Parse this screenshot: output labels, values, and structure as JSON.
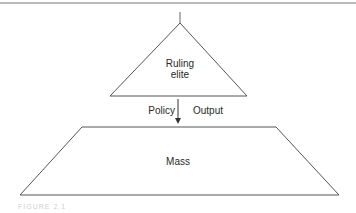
{
  "diagram": {
    "type": "hierarchy",
    "nodes": [
      {
        "id": "ruling-elite",
        "shape": "triangle",
        "label_line1": "Ruling",
        "label_line2": "elite"
      },
      {
        "id": "mass",
        "shape": "trapezoid",
        "label": "Mass"
      }
    ],
    "edges": [
      {
        "from": "ruling-elite",
        "to": "mass",
        "direction": "down",
        "left_label": "Policy",
        "right_label": "Output"
      }
    ],
    "caption": "FIGURE 2.1"
  },
  "colors": {
    "stroke": "#555555",
    "text": "#2a2a2a",
    "background": "#ffffff"
  }
}
